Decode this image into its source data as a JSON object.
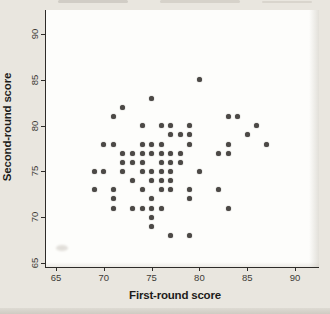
{
  "figure": {
    "colors": {
      "background": "#e9e6df",
      "plot_background": "#fdfdfb",
      "axis": "#2e2c29",
      "tick_text": "#3e3c37",
      "label_text": "#1d1c1a",
      "dot": "#4c4946"
    }
  },
  "chart_data": {
    "type": "scatter",
    "title": "",
    "xlabel": "First-round score",
    "ylabel": "Second-round score",
    "xlim": [
      63.9,
      92.5
    ],
    "ylim": [
      63.5,
      91.5
    ],
    "xticks": [
      65,
      70,
      75,
      80,
      85,
      90
    ],
    "yticks": [
      65,
      70,
      75,
      80,
      85,
      90
    ],
    "grid": false,
    "legend": "none",
    "points": [
      [
        69,
        73
      ],
      [
        69,
        75
      ],
      [
        70,
        75
      ],
      [
        70,
        78
      ],
      [
        71,
        71
      ],
      [
        71,
        72
      ],
      [
        71,
        73
      ],
      [
        71,
        78
      ],
      [
        71,
        81
      ],
      [
        72,
        75
      ],
      [
        72,
        76
      ],
      [
        72,
        77
      ],
      [
        72,
        82
      ],
      [
        73,
        71
      ],
      [
        73,
        74
      ],
      [
        73,
        76
      ],
      [
        73,
        77
      ],
      [
        74,
        71
      ],
      [
        74,
        73
      ],
      [
        74,
        75
      ],
      [
        74,
        76
      ],
      [
        74,
        77
      ],
      [
        74,
        78
      ],
      [
        74,
        80
      ],
      [
        75,
        69
      ],
      [
        75,
        70
      ],
      [
        75,
        71
      ],
      [
        75,
        72
      ],
      [
        75,
        74
      ],
      [
        75,
        75
      ],
      [
        75,
        77
      ],
      [
        75,
        78
      ],
      [
        75,
        83
      ],
      [
        76,
        71
      ],
      [
        76,
        73
      ],
      [
        76,
        74
      ],
      [
        76,
        75
      ],
      [
        76,
        76
      ],
      [
        76,
        77
      ],
      [
        76,
        78
      ],
      [
        76,
        80
      ],
      [
        77,
        68
      ],
      [
        77,
        73
      ],
      [
        77,
        74
      ],
      [
        77,
        75
      ],
      [
        77,
        76
      ],
      [
        77,
        77
      ],
      [
        77,
        79
      ],
      [
        77,
        80
      ],
      [
        78,
        76
      ],
      [
        78,
        77
      ],
      [
        78,
        79
      ],
      [
        79,
        68
      ],
      [
        79,
        72
      ],
      [
        79,
        73
      ],
      [
        79,
        78
      ],
      [
        79,
        79
      ],
      [
        79,
        80
      ],
      [
        80,
        75
      ],
      [
        80,
        85
      ],
      [
        82,
        73
      ],
      [
        82,
        77
      ],
      [
        83,
        71
      ],
      [
        83,
        77
      ],
      [
        83,
        78
      ],
      [
        83,
        81
      ],
      [
        84,
        81
      ],
      [
        85,
        79
      ],
      [
        86,
        80
      ],
      [
        87,
        78
      ]
    ]
  }
}
